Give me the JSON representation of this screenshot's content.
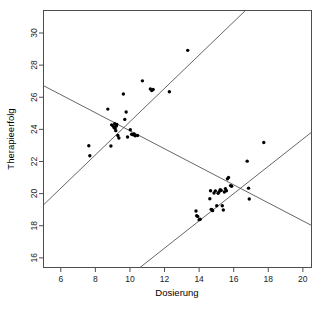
{
  "chart_data": {
    "type": "scatter",
    "title": "",
    "xlabel": "Dosierung",
    "ylabel": "Therapieerfolg",
    "xlim": [
      5.0,
      20.5
    ],
    "ylim": [
      15.4,
      31.4
    ],
    "xticks": [
      6,
      8,
      10,
      12,
      14,
      16,
      18,
      20
    ],
    "yticks": [
      16,
      18,
      20,
      22,
      24,
      26,
      28,
      30
    ],
    "xtick_labels": [
      "6",
      "8",
      "10",
      "12",
      "14",
      "16",
      "18",
      "20"
    ],
    "ytick_labels": [
      "16",
      "18",
      "20",
      "22",
      "24",
      "26",
      "28",
      "30"
    ],
    "grid": false,
    "legend": null,
    "point_color": "#000000",
    "line_color": "#555555",
    "frame_color": "#4d4d4d",
    "series": [
      {
        "name": "Gruppe 1",
        "x": [
          7.62,
          7.68,
          8.72,
          8.9,
          8.94,
          9.02,
          9.08,
          9.12,
          9.14,
          9.18,
          9.2,
          9.24,
          9.3,
          9.36,
          9.62,
          9.7,
          9.78,
          9.86,
          10.02,
          10.1,
          10.18,
          10.24,
          10.3,
          10.44,
          10.72,
          11.18,
          11.26,
          11.34,
          12.28,
          13.34
        ],
        "y": [
          22.98,
          22.36,
          25.26,
          22.96,
          24.28,
          24.22,
          24.12,
          24.36,
          24.06,
          23.92,
          24.2,
          24.3,
          23.62,
          23.46,
          26.2,
          24.62,
          25.08,
          23.52,
          23.98,
          23.7,
          23.66,
          23.72,
          23.6,
          23.62,
          27.02,
          26.52,
          26.42,
          26.48,
          26.34,
          28.92
        ]
      },
      {
        "name": "Gruppe 2",
        "x": [
          13.82,
          13.86,
          13.92,
          14.0,
          14.06,
          14.62,
          14.66,
          14.7,
          14.74,
          14.78,
          14.86,
          14.94,
          15.02,
          15.1,
          15.16,
          15.22,
          15.28,
          15.34,
          15.4,
          15.46,
          15.52,
          15.58,
          15.64,
          15.7,
          15.82,
          15.88,
          16.78,
          16.86,
          16.9,
          17.74
        ],
        "y": [
          18.92,
          18.62,
          18.58,
          18.38,
          18.4,
          19.68,
          20.18,
          19.02,
          19.0,
          18.94,
          20.04,
          20.16,
          19.24,
          20.02,
          20.12,
          20.24,
          20.2,
          19.24,
          18.98,
          20.1,
          20.3,
          20.18,
          20.92,
          21.0,
          20.5,
          20.46,
          22.02,
          20.34,
          19.66,
          23.18
        ]
      }
    ],
    "lines": [
      {
        "name": "Gesamtregression",
        "kind": "descending",
        "x0": 5.0,
        "y0": 26.72,
        "x1": 20.5,
        "y1": 18.02
      },
      {
        "name": "Regression Gruppe 1",
        "kind": "ascending-steep",
        "x0": 5.0,
        "y0": 19.3,
        "x1": 16.68,
        "y1": 31.4
      },
      {
        "name": "Regression Gruppe 2",
        "kind": "ascending-flat",
        "x0": 10.58,
        "y0": 15.4,
        "x1": 20.5,
        "y1": 23.82
      }
    ]
  }
}
